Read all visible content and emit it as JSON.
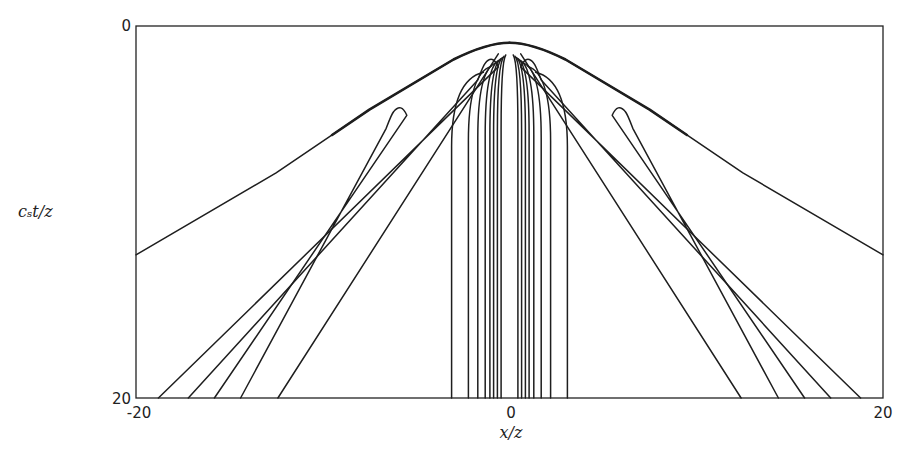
{
  "chart_data": {
    "type": "line",
    "title": "",
    "xlabel": "x/z",
    "ylabel": "c_s t/z",
    "ylabel_display": "cₛt/z",
    "xlim": [
      -20,
      20
    ],
    "ylim": [
      20,
      0
    ],
    "y_inverted": true,
    "grid": false,
    "legend": null,
    "x_ticks": [
      "-20",
      "0",
      "20"
    ],
    "y_ticks": [
      "0",
      "20"
    ],
    "apex": {
      "x": 0.0,
      "y": 0.9
    },
    "envelope": {
      "left": [
        [
          0.0,
          0.9
        ],
        [
          -3.0,
          1.8
        ],
        [
          -7.5,
          4.5
        ],
        [
          -12.5,
          7.9
        ],
        [
          -20.0,
          12.3
        ]
      ],
      "right": [
        [
          0.0,
          0.9
        ],
        [
          3.0,
          1.8
        ],
        [
          7.5,
          4.5
        ],
        [
          12.5,
          7.9
        ],
        [
          20.0,
          12.3
        ]
      ],
      "thick_until_x": 9.5
    },
    "hairpin_loops": [
      {
        "side": "left",
        "tip": [
          -1.1,
          2.0
        ],
        "outer_end": [
          -18.8,
          20
        ],
        "inner_end": [
          -17.2,
          20
        ]
      },
      {
        "side": "left",
        "tip": [
          -6.0,
          4.6
        ],
        "outer_end": [
          -15.8,
          20
        ],
        "inner_end": [
          -14.4,
          20
        ]
      },
      {
        "side": "right",
        "tip": [
          1.1,
          2.0
        ],
        "outer_end": [
          18.8,
          20
        ],
        "inner_end": [
          17.2,
          20
        ]
      },
      {
        "side": "right",
        "tip": [
          6.0,
          4.6
        ],
        "outer_end": [
          15.8,
          20
        ],
        "inner_end": [
          14.4,
          20
        ]
      }
    ],
    "outer_fan_lines": [
      {
        "side": "left",
        "from": [
          -0.6,
          1.5
        ],
        "to": [
          -12.4,
          20
        ]
      },
      {
        "side": "right",
        "from": [
          0.6,
          1.5
        ],
        "to": [
          12.4,
          20
        ]
      }
    ],
    "near_vertical_contours_x_at_bottom": [
      -3.1,
      -2.2,
      -1.7,
      -1.3,
      -1.05,
      -0.85,
      -0.65,
      -0.45,
      0.45,
      0.65,
      0.85,
      1.05,
      1.3,
      1.7,
      2.2,
      3.1
    ]
  }
}
